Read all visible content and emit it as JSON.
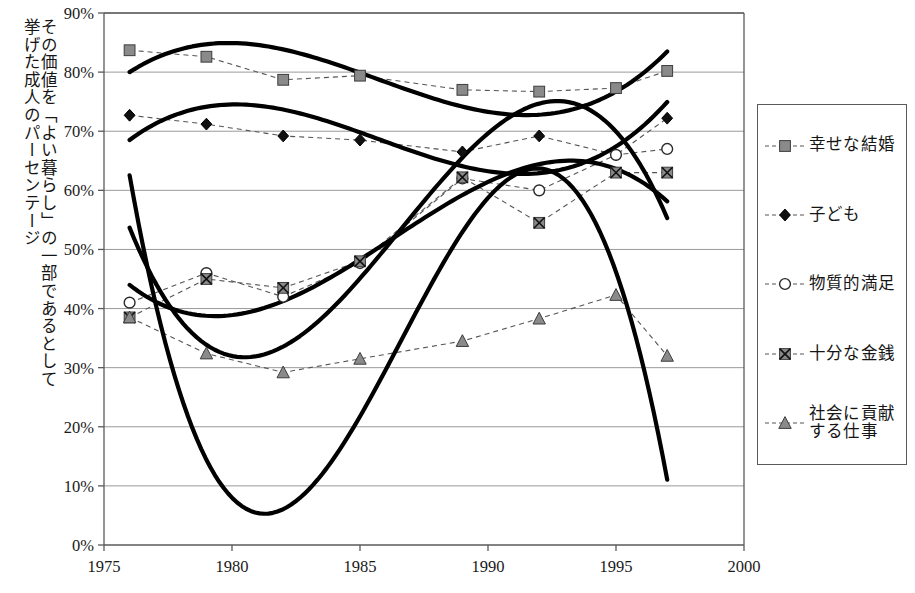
{
  "chart_data": {
    "type": "line",
    "title": "",
    "subtitle": "",
    "xlabel": "",
    "ylabel": "その価値を「よい暮らし」の一部であるとして挙げた成人のパーセンテージ",
    "ylabel_columns": [
      "その価値を「よい暮らし」の一部であるとして",
      "挙げた成人のパーセンテージ"
    ],
    "xlim": [
      1975,
      2000
    ],
    "ylim": [
      0,
      90
    ],
    "x_ticks": [
      1975,
      1980,
      1985,
      1990,
      1995,
      2000
    ],
    "x_tick_labels": [
      "1975",
      "1980",
      "1985",
      "1990",
      "1995",
      "2000"
    ],
    "y_ticks": [
      0,
      10,
      20,
      30,
      40,
      50,
      60,
      70,
      80,
      90
    ],
    "y_tick_labels": [
      "0%",
      "10%",
      "20%",
      "30%",
      "40%",
      "50%",
      "60%",
      "70%",
      "80%",
      "90%"
    ],
    "grid": "horizontal",
    "legend_position": "right-outside",
    "has_trendlines": true,
    "series": [
      {
        "name": "幸せな結婚",
        "marker": "filled-square",
        "color": "#7a7a7a",
        "x": [
          1976,
          1979,
          1982,
          1985,
          1989,
          1992,
          1995,
          1997
        ],
        "values": [
          83.7,
          82.6,
          78.7,
          79.4,
          77.0,
          76.7,
          77.3,
          80.2
        ]
      },
      {
        "name": "子ども",
        "marker": "filled-diamond",
        "color": "#101010",
        "x": [
          1976,
          1979,
          1982,
          1985,
          1989,
          1992,
          1995,
          1997
        ],
        "values": [
          72.7,
          71.2,
          69.2,
          68.5,
          66.5,
          69.2,
          66.0,
          72.2
        ]
      },
      {
        "name": "物質的満足",
        "marker": "open-circle",
        "color": "#ffffff",
        "x": [
          1976,
          1979,
          1982,
          1985,
          1989,
          1992,
          1995,
          1997
        ],
        "values": [
          41.0,
          46.0,
          42.0,
          47.7,
          62.0,
          60.0,
          66.0,
          67.0
        ]
      },
      {
        "name": "十分な金銭",
        "marker": "x-square",
        "color": "#8a8a8a",
        "x": [
          1976,
          1979,
          1982,
          1985,
          1989,
          1992,
          1995,
          1997
        ],
        "values": [
          38.5,
          45.0,
          43.5,
          48.0,
          62.2,
          54.5,
          63.0,
          63.0
        ]
      },
      {
        "name": "社会に貢献する仕事",
        "marker": "filled-triangle",
        "color": "#8a8a8a",
        "x": [
          1976,
          1979,
          1982,
          1985,
          1989,
          1992,
          1995,
          1997
        ],
        "values": [
          38.5,
          32.4,
          29.2,
          31.5,
          34.5,
          38.3,
          42.3,
          32.0
        ]
      }
    ]
  },
  "legend": {
    "items": [
      {
        "label": "幸せな結婚",
        "marker": "filled-square"
      },
      {
        "label": "子ども",
        "marker": "filled-diamond"
      },
      {
        "label": "物質的満足",
        "marker": "open-circle"
      },
      {
        "label": "十分な金銭",
        "marker": "x-square"
      },
      {
        "label": "社会に貢献する仕事",
        "marker": "filled-triangle",
        "label_line1": "社会に貢献",
        "label_line2": "する仕事"
      }
    ]
  },
  "colors": {
    "axis": "#5a5a5a",
    "grid": "#9a9a9a",
    "trendline": "#000000",
    "dashed": "#555555",
    "marker_gray": "#8a8a8a",
    "marker_dark": "#101010"
  }
}
